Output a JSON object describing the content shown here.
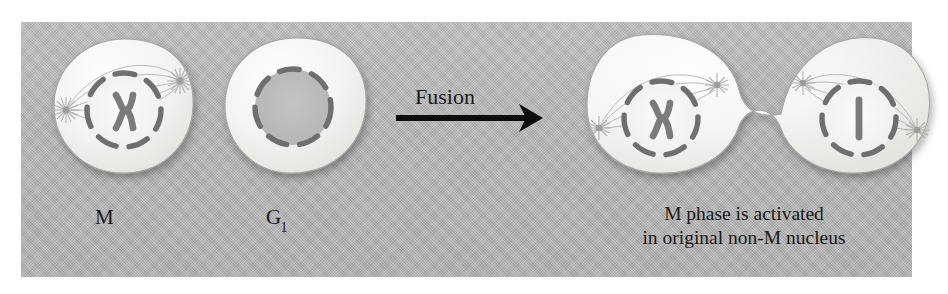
{
  "figure": {
    "kind": "cell-fusion-diagram",
    "background_color": "#ffffff",
    "panel_color": "#b6b6b6",
    "ink_color": "#1a1a18",
    "cytoplasm_color": "#f2f2f0",
    "nucleus_dash_color": "#6f6f6f",
    "chromosome_color": "#7b7b7b",
    "spindle_color": "#9a9a9a"
  },
  "labels": {
    "m_cell": "M",
    "g1_cell_main": "G",
    "g1_cell_sub": "1",
    "fusion_arrow": "Fusion"
  },
  "caption": {
    "line1": "M phase is activated",
    "line2": "in original non-M nucleus"
  },
  "cells": [
    {
      "id": "m-cell",
      "label": "M",
      "state": "mitotic",
      "nucleus": "dashed-envelope-breaking-down",
      "chromosome": "x-shaped-replicated",
      "centrosomes": 2,
      "spindle": true
    },
    {
      "id": "g1-cell",
      "label": "G1",
      "state": "interphase",
      "nucleus": "dashed-intact-envelope",
      "chromosome": "none-visible",
      "centrosomes": 0,
      "spindle": false
    },
    {
      "id": "fused-cell",
      "label": "M phase is activated in original non-M nucleus",
      "state": "fused-heterokaryon",
      "lobes": [
        {
          "id": "fused-left-lobe",
          "origin": "M",
          "nucleus": "dashed-envelope",
          "chromosome": "x-shaped-replicated"
        },
        {
          "id": "fused-right-lobe",
          "origin": "G1",
          "nucleus": "dashed-envelope",
          "chromosome": "i-shaped-unreplicated"
        }
      ],
      "centrosomes": 4,
      "spindle": true
    }
  ],
  "arrow": {
    "name": "fusion-arrow",
    "direction": "right",
    "color": "#0d0d0d"
  }
}
